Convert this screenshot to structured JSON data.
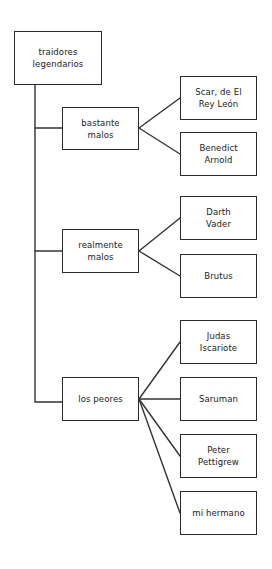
{
  "diagram": {
    "type": "tree",
    "root": {
      "label": "traidores\nlegendarios",
      "box": {
        "x": 14,
        "y": 31,
        "w": 88,
        "h": 54
      }
    },
    "trunk": {
      "x": 35,
      "y1": 85,
      "y2": 402
    },
    "categories": [
      {
        "label": "bastante\nmalos",
        "box": {
          "x": 62,
          "y": 107,
          "w": 77,
          "h": 43
        },
        "connector_y": 128,
        "children": [
          {
            "label": "Scar, de El\nRey León",
            "box": {
              "x": 180,
              "y": 76,
              "w": 77,
              "h": 44
            }
          },
          {
            "label": "Benedict\nArnold",
            "box": {
              "x": 180,
              "y": 132,
              "w": 77,
              "h": 44
            }
          }
        ]
      },
      {
        "label": "realmente\nmalos",
        "box": {
          "x": 62,
          "y": 229,
          "w": 77,
          "h": 44
        },
        "connector_y": 251,
        "children": [
          {
            "label": "Darth\nVader",
            "box": {
              "x": 180,
              "y": 196,
              "w": 77,
              "h": 44
            }
          },
          {
            "label": "Brutus",
            "box": {
              "x": 180,
              "y": 254,
              "w": 77,
              "h": 44
            }
          }
        ]
      },
      {
        "label": "los peores",
        "box": {
          "x": 62,
          "y": 377,
          "w": 77,
          "h": 44
        },
        "connector_y": 402,
        "children": [
          {
            "label": "Judas\nIscariote",
            "box": {
              "x": 180,
              "y": 320,
              "w": 77,
              "h": 44
            }
          },
          {
            "label": "Saruman",
            "box": {
              "x": 180,
              "y": 377,
              "w": 77,
              "h": 44
            }
          },
          {
            "label": "Peter\nPettigrew",
            "box": {
              "x": 180,
              "y": 434,
              "w": 77,
              "h": 44
            }
          },
          {
            "label": "mi hermano",
            "box": {
              "x": 180,
              "y": 491,
              "w": 77,
              "h": 44
            }
          }
        ]
      }
    ],
    "colors": {
      "stroke": "#2a2a2a",
      "text": "#222222",
      "background": "#ffffff"
    }
  }
}
